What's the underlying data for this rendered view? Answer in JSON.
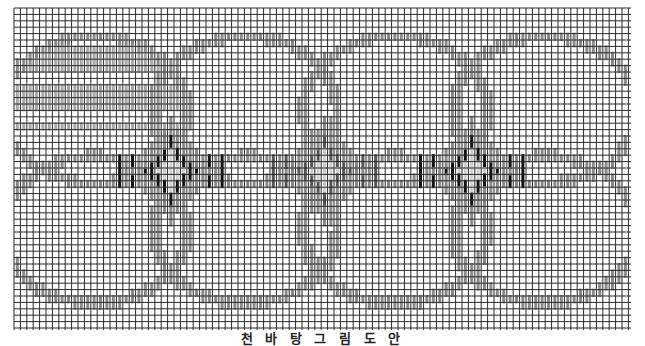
{
  "caption": "천 바 탕 그 림 도 안",
  "grid": {
    "left": 14,
    "top": 8,
    "right": 631,
    "bottom": 330,
    "pitch": 6.4,
    "line_color": "#2a2a2a"
  },
  "colors": {
    "grey_stitch": "#8a8a8a",
    "dark_stitch": "#111111",
    "light_stitch": "#d0d0d0",
    "fill_stitch": "#a8a8a8"
  },
  "motifs": {
    "circles": [
      {
        "cx": 95,
        "cy": 110,
        "r": 92,
        "filled": true
      },
      {
        "cx": 245,
        "cy": 110,
        "r": 92,
        "filled": false
      },
      {
        "cx": 395,
        "cy": 110,
        "r": 92,
        "filled": false
      },
      {
        "cx": 545,
        "cy": 110,
        "r": 92,
        "filled": false
      },
      {
        "cx": 95,
        "cy": 230,
        "r": 92,
        "filled": false
      },
      {
        "cx": 245,
        "cy": 230,
        "r": 92,
        "filled": false
      },
      {
        "cx": 395,
        "cy": 230,
        "r": 92,
        "filled": false
      },
      {
        "cx": 545,
        "cy": 230,
        "r": 92,
        "filled": false
      }
    ],
    "diamonds": [
      {
        "cx": 170,
        "cy": 170,
        "style": "dark"
      },
      {
        "cx": 320,
        "cy": 170,
        "style": "grey"
      },
      {
        "cx": 470,
        "cy": 170,
        "style": "dark"
      }
    ]
  }
}
